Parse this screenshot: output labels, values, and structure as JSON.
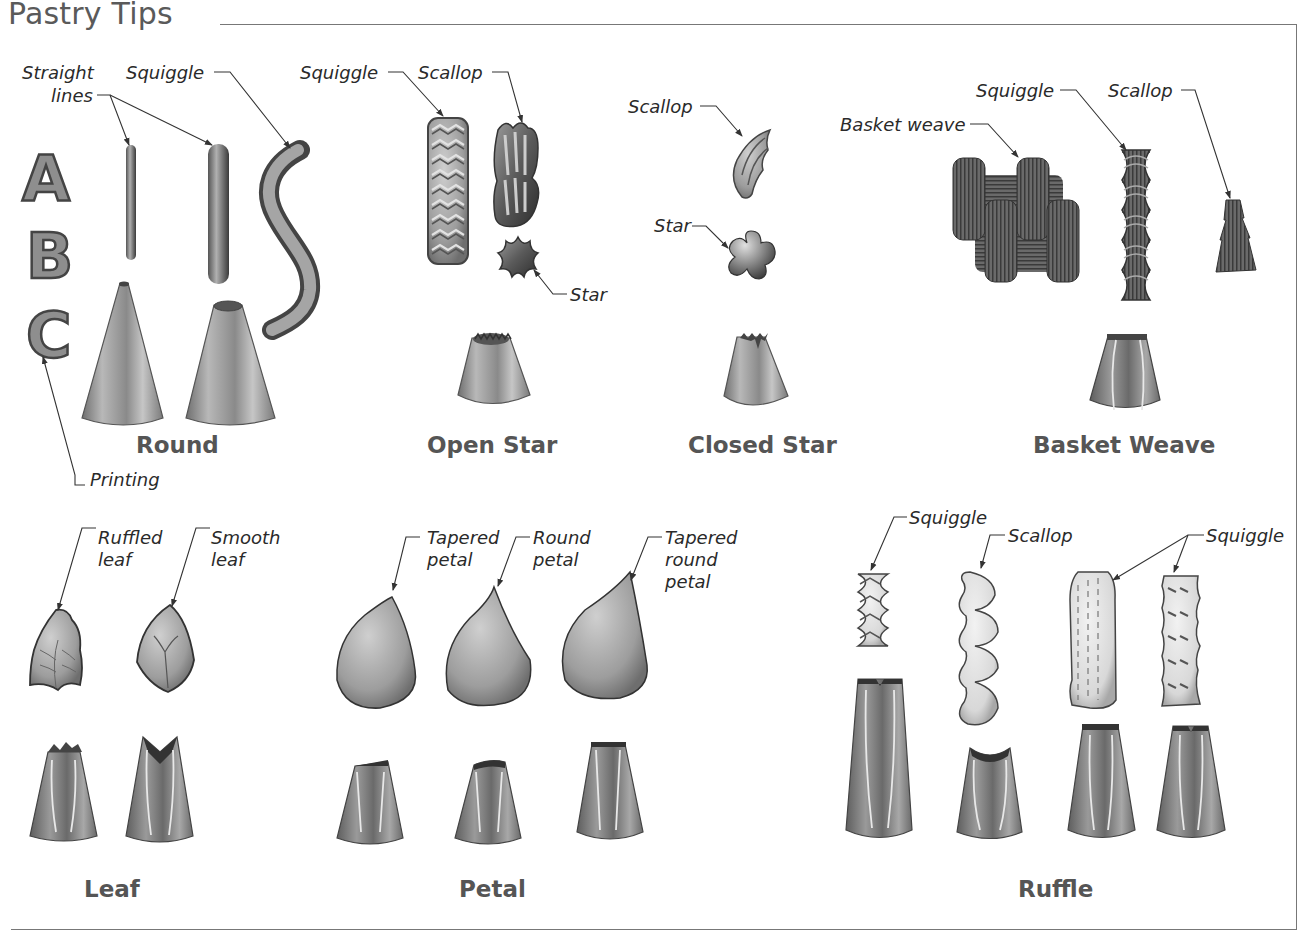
{
  "title": "Pastry Tips",
  "sections": {
    "round": {
      "label": "Round",
      "callouts": {
        "straight_lines_1": "Straight",
        "straight_lines_2": "lines",
        "squiggle": "Squiggle",
        "printing": "Printing"
      },
      "printing_letters": [
        "A",
        "B",
        "C"
      ]
    },
    "open_star": {
      "label": "Open Star",
      "callouts": {
        "squiggle": "Squiggle",
        "scallop": "Scallop",
        "star": "Star"
      }
    },
    "closed_star": {
      "label": "Closed Star",
      "callouts": {
        "scallop": "Scallop",
        "star": "Star"
      }
    },
    "basket_weave": {
      "label": "Basket Weave",
      "callouts": {
        "basket_weave": "Basket weave",
        "squiggle": "Squiggle",
        "scallop": "Scallop"
      }
    },
    "leaf": {
      "label": "Leaf",
      "callouts": {
        "ruffled_1": "Ruffled",
        "ruffled_2": "leaf",
        "smooth_1": "Smooth",
        "smooth_2": "leaf"
      }
    },
    "petal": {
      "label": "Petal",
      "callouts": {
        "tapered_1": "Tapered",
        "tapered_2": "petal",
        "round_1": "Round",
        "round_2": "petal",
        "tapered_round_1": "Tapered",
        "tapered_round_2": "round",
        "tapered_round_3": "petal"
      }
    },
    "ruffle": {
      "label": "Ruffle",
      "callouts": {
        "squiggle_1": "Squiggle",
        "scallop": "Scallop",
        "squiggle_2": "Squiggle"
      }
    }
  },
  "colors": {
    "frame": "#777777",
    "title": "#5a5a5a",
    "section_label": "#555555",
    "callout": "#2a2a2a",
    "leader": "#333333"
  }
}
